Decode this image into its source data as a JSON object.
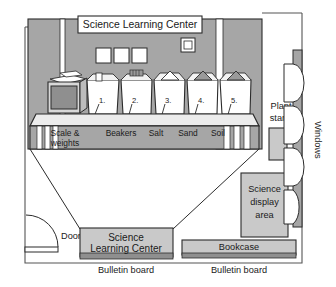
{
  "diagram": {
    "type": "classroom-floor-plan"
  },
  "colors": {
    "wall_gray": "#a6a6a6",
    "furniture_gray": "#c9c9c9",
    "counter_gray": "#e2e2e2",
    "dark_gray": "#8f8f8f",
    "line": "#2b2b2b",
    "white": "#ffffff"
  },
  "back_wall": {
    "banner_label": "Science Learning Center",
    "poster_count": 3,
    "switch_plate": "wall-switch"
  },
  "counter": {
    "scale_label": "scale-equipment",
    "bins": [
      {
        "number": "1.",
        "label_line1": "Scale &",
        "label_line2": "weights"
      },
      {
        "number": "2.",
        "label_line1": "Beakers",
        "label_line2": ""
      },
      {
        "number": "3.",
        "label_line1": "Salt",
        "label_line2": ""
      },
      {
        "number": "4.",
        "label_line1": "Sand",
        "label_line2": ""
      },
      {
        "number": "5.",
        "label_line1": "Soil",
        "label_line2": ""
      }
    ]
  },
  "room_features": {
    "door_label": "Door",
    "plant_stand_line1": "Plant",
    "plant_stand_line2": "stand",
    "windows_label": "Windows",
    "window_count": 4,
    "display_area_line1": "Science",
    "display_area_line2": "display",
    "display_area_line3": "area",
    "rug_line1": "Science",
    "rug_line2": "Learning Center",
    "bookcase_label": "Bookcase",
    "bulletin_board_left": "Bulletin board",
    "bulletin_board_right": "Bulletin board"
  }
}
